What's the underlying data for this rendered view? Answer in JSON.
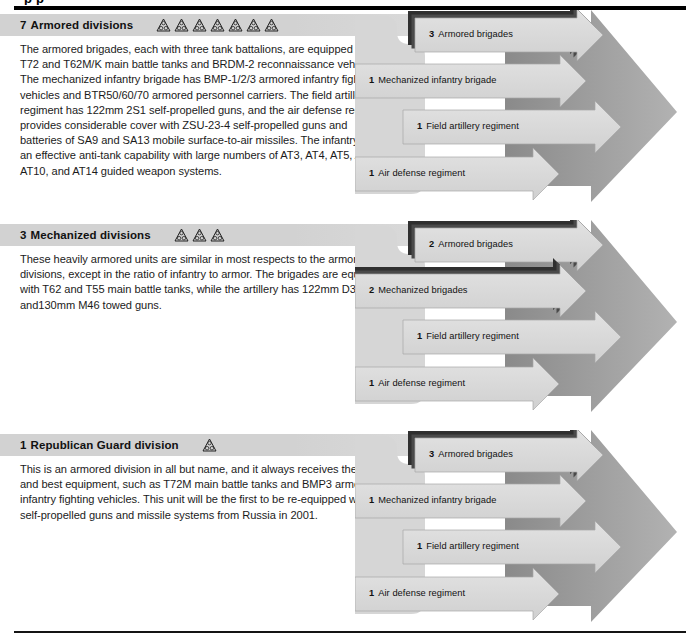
{
  "page": {
    "clipped_header_fragment": "p  p",
    "background": "#ffffff",
    "rule_color": "#000000"
  },
  "palette": {
    "heading_band": "#d2d2d2",
    "big_arrow_dark": "#8f8f8f",
    "big_arrow_light": "#a9a9a9",
    "sub_arrow": "#d9d9d9",
    "sub_arrow_edge": "#9a9a9a",
    "stack_shadow": "#3a3a3a",
    "text": "#1b1b1b"
  },
  "icon_names": {
    "division": "division-triangle-icon",
    "arrow": "right-arrow-shape"
  },
  "sections": [
    {
      "id": "armored",
      "count": "7",
      "title": "Armored divisions",
      "icon_count": 7,
      "body": "The armored brigades, each with three tank battalions, are equipped with T72 and T62M/K main battle tanks and BRDM-2 reconnaissance vehicles. The mechanized infantry brigade has BMP-1/2/3 armored infantry fighting vehicles and BTR50/60/70 armored personnel carriers. The field artillery regiment has 122mm 2S1 self-propelled guns, and the air defense regiment provides considerable cover with ZSU-23-4 self-propelled guns and batteries of SA9 and SA13 mobile surface-to-air missiles. The infantry has an effective anti-tank capability with large numbers of AT3, AT4, AT5, AT7, AT10, and AT14 guided weapon systems.",
      "units": [
        {
          "qty": "3",
          "label": "Armored brigades",
          "stacked": true
        },
        {
          "qty": "1",
          "label": "Mechanized infantry brigade",
          "stacked": false
        },
        {
          "qty": "1",
          "label": "Field artillery regiment",
          "stacked": false
        },
        {
          "qty": "1",
          "label": "Air defense regiment",
          "stacked": false
        }
      ]
    },
    {
      "id": "mechanized",
      "count": "3",
      "title": "Mechanized divisions",
      "icon_count": 3,
      "body": "These heavily armored units are similar in most respects to the armored divisions, except in the ratio of infantry to armor. The brigades are equipped with T62 and T55 main battle tanks, while the artillery has 122mm D30 and130mm M46 towed guns.",
      "units": [
        {
          "qty": "2",
          "label": "Armored brigades",
          "stacked": true
        },
        {
          "qty": "2",
          "label": "Mechanized brigades",
          "stacked": true
        },
        {
          "qty": "1",
          "label": "Field artillery regiment",
          "stacked": false
        },
        {
          "qty": "1",
          "label": "Air defense regiment",
          "stacked": false
        }
      ]
    },
    {
      "id": "republican-guard",
      "count": "1",
      "title": "Republican Guard division",
      "icon_count": 1,
      "body": "This is an armored division in all but name, and it always receives the latest and best equipment, such as T72M main battle tanks and  BMP3 armored infantry fighting vehicles. This unit will be the first to be re-equipped with new self-propelled guns and missile systems from Russia in 2001.",
      "units": [
        {
          "qty": "3",
          "label": "Armored brigades",
          "stacked": true
        },
        {
          "qty": "1",
          "label": "Mechanized infantry brigade",
          "stacked": false
        },
        {
          "qty": "1",
          "label": "Field artillery regiment",
          "stacked": false
        },
        {
          "qty": "1",
          "label": "Air defense regiment",
          "stacked": false
        }
      ]
    }
  ]
}
